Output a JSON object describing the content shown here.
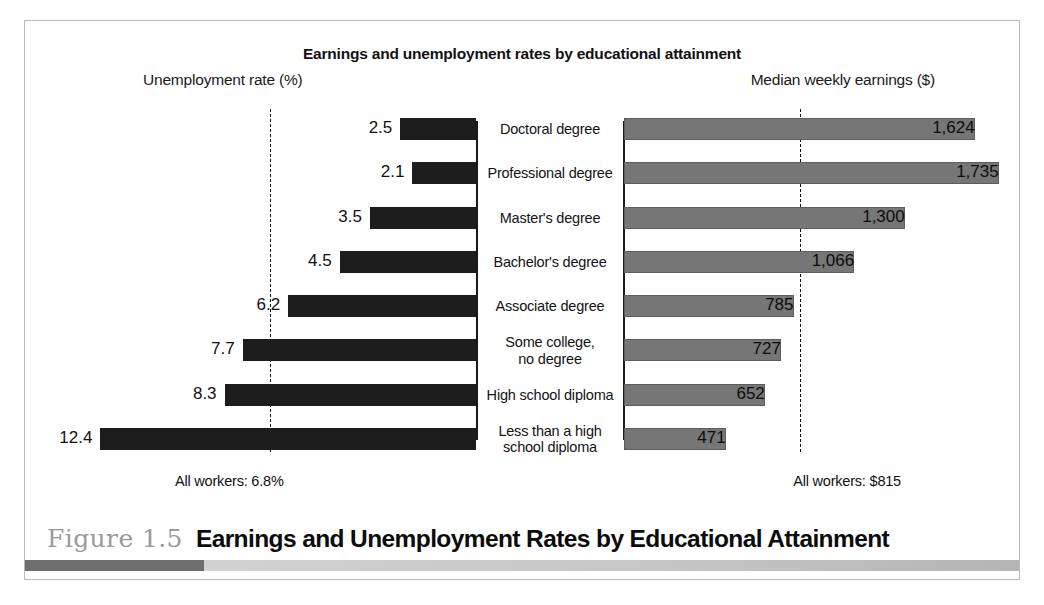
{
  "figure": {
    "number_label": "Figure 1.5",
    "caption": "Earnings and Unemployment Rates by Educational Attainment"
  },
  "chart_data": {
    "type": "bar",
    "title": "Earnings and unemployment rates by educational attainment",
    "orientation": "horizontal-bidirectional",
    "categories": [
      "Doctoral degree",
      "Professional degree",
      "Master's degree",
      "Bachelor's degree",
      "Associate degree",
      "Some college, no degree",
      "High school diploma",
      "Less than a high school diploma"
    ],
    "panels": {
      "left": {
        "axis_title": "Unemployment rate (%)",
        "xlabel": "Unemployment rate (%)",
        "values": [
          2.5,
          2.1,
          3.5,
          4.5,
          6.2,
          7.7,
          8.3,
          12.4
        ],
        "value_labels": [
          "2.5",
          "2.1",
          "3.5",
          "4.5",
          "6.2",
          "7.7",
          "8.3",
          "12.4"
        ],
        "reference_line": 6.8,
        "reference_note": "All workers: 6.8%",
        "xlim": [
          0,
          14
        ],
        "bar_color": "#1d1d1d",
        "direction": "right-to-left"
      },
      "right": {
        "axis_title": "Median weekly earnings ($)",
        "xlabel": "Median weekly earnings ($)",
        "values": [
          1624,
          1735,
          1300,
          1066,
          785,
          727,
          652,
          471
        ],
        "value_labels": [
          "1,624",
          "1,735",
          "1,300",
          "1,066",
          "785",
          "727",
          "652",
          "471"
        ],
        "reference_line": 815,
        "reference_note": "All workers: $815",
        "xlim": [
          0,
          1900
        ],
        "bar_color": "#767676",
        "direction": "left-to-right"
      }
    },
    "grid": false,
    "legend": "none"
  }
}
